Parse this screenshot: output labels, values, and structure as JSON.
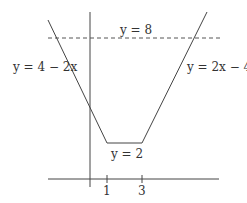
{
  "diagram": {
    "type": "piecewise-linear-graph",
    "axes": {
      "x_ticks": [
        "1",
        "3"
      ]
    },
    "labels": {
      "horizontal_line": "y = 8",
      "left_line": "y = 4 − 2x",
      "right_line": "y = 2x − 4",
      "bottom_segment": "y = 2"
    },
    "colors": {
      "line": "#444444",
      "background": "#ffffff"
    }
  }
}
